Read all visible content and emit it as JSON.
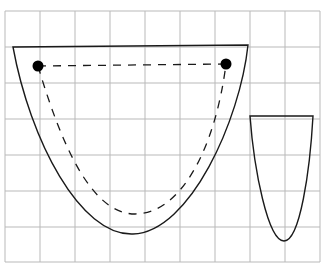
{
  "figure": {
    "type": "geometry-diagram",
    "background": "#ffffff",
    "grid": {
      "color": "#b9b9b9",
      "x_lines": [
        5,
        40,
        75,
        110,
        145,
        180,
        215,
        250,
        285,
        320
      ],
      "y_lines": [
        11,
        47,
        83,
        119,
        155,
        191,
        227,
        262
      ],
      "x_start": 5,
      "x_end": 320,
      "y_start": 11,
      "y_end": 262
    },
    "shapes": [
      {
        "name": "large-bowl",
        "style": "solid",
        "color": "#1a1a1a",
        "path": "M13,47 L248,45 C240,120 190,232 133,234 C80,236 30,140 13,47 Z"
      },
      {
        "name": "dashed-bowl",
        "style": "dashed",
        "color": "#1a1a1a",
        "path": "M38,66 L226,64 M38,66 C60,140 90,214 135,214 C180,214 215,150 226,64"
      },
      {
        "name": "small-bowl",
        "style": "solid",
        "color": "#1a1a1a",
        "path": "M250,116 L313,116 C310,170 300,241 284,241 C268,241 254,170 250,116 Z"
      }
    ],
    "points": [
      {
        "name": "left-point",
        "cx": 38,
        "cy": 66,
        "r": 5.5
      },
      {
        "name": "right-point",
        "cx": 226,
        "cy": 64,
        "r": 5.5
      }
    ]
  }
}
